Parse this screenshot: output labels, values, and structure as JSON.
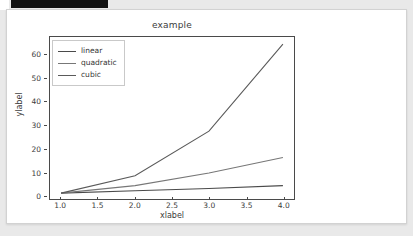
{
  "window": {
    "redacted_bar": "",
    "card_background": "#ffffff",
    "page_background": "#e9e9e9"
  },
  "chart_data": {
    "type": "line",
    "title": "example",
    "xlabel": "xlabel",
    "ylabel": "ylabel",
    "x": [
      1.0,
      2.0,
      3.0,
      4.0
    ],
    "series": [
      {
        "name": "linear",
        "values": [
          1.0,
          2.0,
          3.0,
          4.2
        ],
        "color": "#4a4a4a"
      },
      {
        "name": "quadratic",
        "values": [
          1.0,
          4.2,
          9.6,
          16.2
        ],
        "color": "#777777"
      },
      {
        "name": "cubic",
        "values": [
          1.0,
          8.4,
          27.4,
          64.5
        ],
        "color": "#5a5a5a"
      }
    ],
    "xlim": [
      0.85,
      4.15
    ],
    "ylim": [
      -1.5,
      67.5
    ],
    "xticks": [
      "1.0",
      "1.5",
      "2.0",
      "2.5",
      "3.0",
      "3.5",
      "4.0"
    ],
    "xtick_values": [
      1.0,
      1.5,
      2.0,
      2.5,
      3.0,
      3.5,
      4.0
    ],
    "yticks": [
      "0",
      "10",
      "20",
      "30",
      "40",
      "50",
      "60"
    ],
    "ytick_values": [
      0,
      10,
      20,
      30,
      40,
      50,
      60
    ],
    "grid": false,
    "legend_position": "upper left"
  }
}
